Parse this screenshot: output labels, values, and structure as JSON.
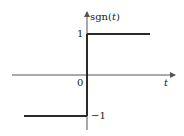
{
  "diagram": {
    "function_label": "sgn(",
    "function_arg": "t",
    "function_close": ")",
    "x_axis_label": "t",
    "origin_label": "0",
    "high_label": "1",
    "low_label": "−1",
    "colors": {
      "line": "#2a2a2a",
      "axis": "#555555"
    }
  }
}
